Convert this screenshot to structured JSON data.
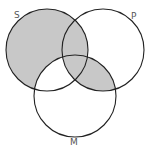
{
  "diagram": {
    "type": "venn-3",
    "colors": {
      "shade": "#c8c8c8",
      "stroke": "#222222",
      "background": "#ffffff",
      "label": "#555555"
    },
    "circles": [
      {
        "id": "S",
        "label": "S",
        "cx": 47,
        "cy": 50,
        "r": 41
      },
      {
        "id": "P",
        "label": "P",
        "cx": 103,
        "cy": 50,
        "r": 41
      },
      {
        "id": "M",
        "label": "M",
        "cx": 75,
        "cy": 96,
        "r": 41
      }
    ],
    "labels": {
      "S": "S",
      "P": "P",
      "M": "M"
    },
    "shaded_regions": [
      "S only",
      "S∩P only",
      "S∩P∩M",
      "P∩M only"
    ],
    "unshaded_regions": [
      "P only",
      "M only",
      "S∩M only"
    ]
  }
}
